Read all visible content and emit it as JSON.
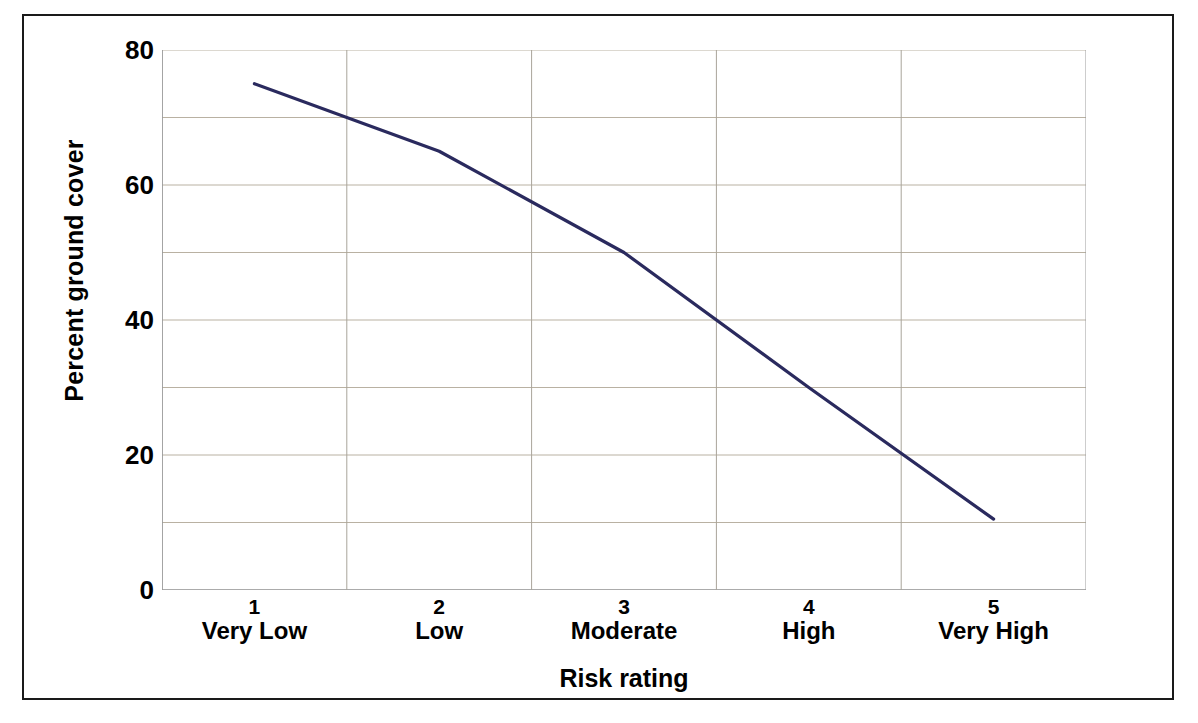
{
  "chart_data": {
    "type": "line",
    "title": "",
    "xlabel": "Risk rating",
    "ylabel": "Percent ground cover",
    "categories": [
      "1",
      "2",
      "3",
      "4",
      "5"
    ],
    "category_names": [
      "Very Low",
      "Low",
      "Moderate",
      "High",
      "Very High"
    ],
    "series": [
      {
        "name": "Percent ground cover",
        "values": [
          75,
          65,
          50,
          30,
          10.5
        ],
        "color": "#2a2a5e"
      }
    ],
    "ylim": [
      0,
      80
    ],
    "y_ticks": [
      0,
      20,
      40,
      60,
      80
    ],
    "y_tick_labels": [
      "0",
      "20",
      "40",
      "60",
      "80"
    ],
    "y_gridline_values": [
      0,
      10,
      20,
      30,
      40,
      50,
      60,
      70,
      80
    ],
    "grid": true,
    "grid_color": "#b9b1a2",
    "legend": "none",
    "axis_color": "#9a9a9a",
    "frame_color": "#1a1a1a",
    "background": "#ffffff"
  },
  "axes": {
    "y_title": "Percent ground cover",
    "x_title": "Risk rating",
    "y_ticks": [
      {
        "label": "80",
        "value": 80
      },
      {
        "label": "60",
        "value": 60
      },
      {
        "label": "40",
        "value": 40
      },
      {
        "label": "20",
        "value": 20
      },
      {
        "label": "0",
        "value": 0
      }
    ],
    "x_ticks": [
      {
        "num": "1",
        "name": "Very Low"
      },
      {
        "num": "2",
        "name": "Low"
      },
      {
        "num": "3",
        "name": "Moderate"
      },
      {
        "num": "4",
        "name": "High"
      },
      {
        "num": "5",
        "name": "Very High"
      }
    ]
  }
}
